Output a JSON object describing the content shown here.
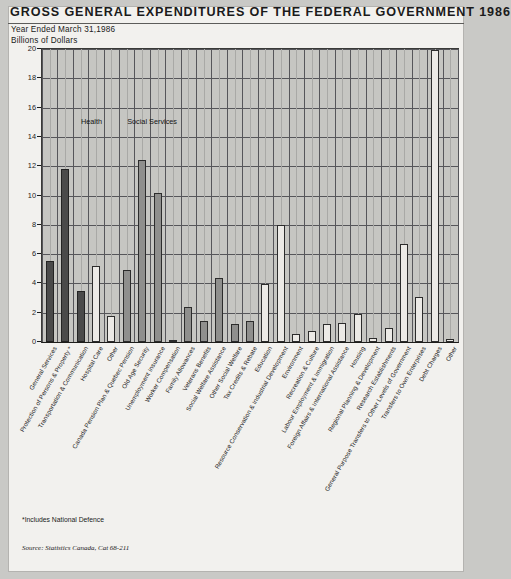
{
  "header": {
    "title": "GROSS GENERAL EXPENDITURES OF THE FEDERAL GOVERNMENT 1986",
    "subtitle": "Year Ended March 31,1986",
    "units": "Billions of Dollars"
  },
  "footer": {
    "footnote": "*Includes National Defence",
    "source": "Source: Statistics Canada, Cat 68-211"
  },
  "chart_data": {
    "type": "bar",
    "title": "GROSS GENERAL EXPENDITURES OF THE FEDERAL GOVERNMENT 1986",
    "subtitle": "Year Ended March 31,1986",
    "xlabel": "",
    "ylabel": "Billions of Dollars",
    "ylim": [
      0,
      20
    ],
    "ytick_values": [
      0,
      2,
      4,
      6,
      8,
      10,
      12,
      14,
      16,
      18,
      20
    ],
    "ytick_labels": [
      "0",
      "2",
      "4",
      "6",
      "8",
      "10",
      "12",
      "14",
      "16",
      "18",
      "20"
    ],
    "grid": true,
    "legend": "none",
    "annotations": [
      {
        "text": "Health",
        "x_category": "Hospital Care",
        "y_value": 15.3
      },
      {
        "text": "Social Services",
        "x_category": "Old Age Security",
        "y_value": 15.3
      }
    ],
    "categories": [
      "General Services",
      "Protection of Persons & Property *",
      "Transportation & Communication",
      "Hospital Care",
      "Other",
      "Canada Pension Plan & Quebec Pension",
      "Old Age Security",
      "Unemployment Insurance",
      "Worker Compensation",
      "Family Allowances",
      "Veterans Benefits",
      "Social Welfare Assistance",
      "Other Social Welfare",
      "Tax Credits & Rebate",
      "Education",
      "Resource Conservation & Industrial Development",
      "Environment",
      "Recreation & Culture",
      "Labour Employment & Immigration",
      "Foreign Affairs & International Assistance",
      "Housing",
      "Regional Planning & Development",
      "Research Establishments",
      "General Purpose Transfers to Other Levels of Government",
      "Transfers to Own Enterprises",
      "Debt Charges",
      "Other"
    ],
    "values": [
      5.5,
      11.8,
      3.5,
      5.2,
      1.75,
      4.9,
      12.45,
      10.2,
      0.1,
      2.4,
      1.45,
      4.4,
      1.2,
      1.45,
      3.95,
      8.0,
      0.55,
      0.75,
      1.2,
      1.3,
      1.9,
      0.3,
      0.95,
      6.7,
      3.1,
      19.9,
      0.2
    ],
    "bar_styles": [
      "dark",
      "dark",
      "dark",
      "light",
      "light",
      "mid",
      "mid",
      "mid",
      "mid",
      "mid",
      "mid",
      "mid",
      "mid",
      "mid",
      "light",
      "light",
      "light",
      "light",
      "light",
      "light",
      "light",
      "light",
      "light",
      "light",
      "light",
      "light",
      "light"
    ]
  }
}
